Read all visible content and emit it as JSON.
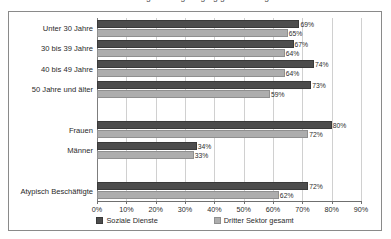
{
  "figure": {
    "clipped_title_remnant": "Abbildung: Anteil geringfügig Beschäftigter",
    "frame_border_color": "#8a8a8a"
  },
  "legend": {
    "position": "bottom",
    "items": [
      {
        "label": "Soziale Dienste",
        "color": "#4d4d4d",
        "swatch": "square-swatch"
      },
      {
        "label": "Dritter Sektor gesamt",
        "color": "#adadad",
        "swatch": "square-swatch"
      }
    ]
  },
  "axis": {
    "x_ticks": [
      "0%",
      "10%",
      "20%",
      "30%",
      "40%",
      "50%",
      "60%",
      "70%",
      "80%",
      "90%"
    ],
    "x_tick_values": [
      0,
      10,
      20,
      30,
      40,
      50,
      60,
      70,
      80,
      90
    ]
  },
  "chart_data": {
    "type": "bar",
    "orientation": "horizontal",
    "title": "",
    "subtitle": "",
    "xlabel": "",
    "ylabel": "",
    "xlim": [
      0,
      90
    ],
    "grid": true,
    "grid_axis": "x",
    "legend_position": "bottom",
    "value_label_suffix": "%",
    "categories": [
      "Unter 30 Jahre",
      "30 bis 39 Jahre",
      "40 bis 49 Jahre",
      "50 Jahre und älter",
      "",
      "Frauen",
      "Männer",
      "",
      "Atypisch Beschäftigte"
    ],
    "series": [
      {
        "name": "Soziale Dienste",
        "color": "#4d4d4d",
        "values": [
          69,
          67,
          74,
          73,
          null,
          80,
          34,
          null,
          72
        ],
        "labels": [
          "69%",
          "67%",
          "74%",
          "73%",
          "",
          "80%",
          "34%",
          "",
          "72%"
        ]
      },
      {
        "name": "Dritter Sektor gesamt",
        "color": "#adadad",
        "values": [
          65,
          64,
          64,
          59,
          null,
          72,
          33,
          null,
          62
        ],
        "labels": [
          "65%",
          "64%",
          "64%",
          "59%",
          "",
          "72%",
          "33%",
          "",
          "62%"
        ]
      }
    ]
  }
}
